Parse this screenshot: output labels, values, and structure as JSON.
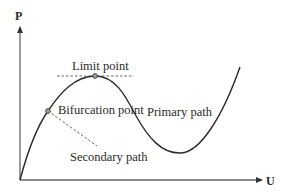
{
  "diagram": {
    "type": "load-displacement curve",
    "axes": {
      "y_label": "P",
      "x_label": "U"
    },
    "labels": {
      "limit_point": "Limit point",
      "bifurcation_point": "Bifurcation point",
      "primary_path": "Primary path",
      "secondary_path": "Secondary path"
    },
    "colors": {
      "curve": "#2a2a2a",
      "axis": "#555555",
      "dashed": "#555555",
      "marker_fill": "#9a9a9a",
      "text": "#2a2a2a",
      "background": "#ffffff"
    }
  }
}
